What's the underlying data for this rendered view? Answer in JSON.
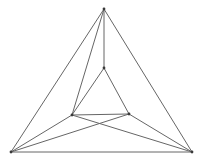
{
  "figure": {
    "canvas": {
      "width": 203,
      "height": 163,
      "background": "#ffffff"
    },
    "style": {
      "stroke_color": "#666666",
      "stroke_width": 1,
      "vertex_color": "#3a3a3a"
    },
    "vertices": [
      {
        "id": "outer-apex",
        "name": "outer-top-vertex",
        "x": 104,
        "y": 9
      },
      {
        "id": "outer-bottom-left",
        "name": "outer-bottom-left-vertex",
        "x": 11,
        "y": 152
      },
      {
        "id": "outer-bottom-right",
        "name": "outer-bottom-right-vertex",
        "x": 192,
        "y": 152
      },
      {
        "id": "inner-apex",
        "name": "inner-top-vertex",
        "x": 104,
        "y": 68
      },
      {
        "id": "inner-bottom-left",
        "name": "inner-bottom-left-vertex",
        "x": 72,
        "y": 115
      },
      {
        "id": "inner-bottom-right",
        "name": "inner-bottom-right-vertex",
        "x": 129,
        "y": 114
      }
    ],
    "edges": [
      {
        "id": "outer-left-edge",
        "name": "outer-left-edge",
        "from": "outer-apex",
        "to": "outer-bottom-left"
      },
      {
        "id": "outer-right-edge",
        "name": "outer-right-edge",
        "from": "outer-apex",
        "to": "outer-bottom-right"
      },
      {
        "id": "outer-bottom-edge",
        "name": "outer-bottom-edge",
        "from": "outer-bottom-left",
        "to": "outer-bottom-right"
      },
      {
        "id": "inner-left-edge",
        "name": "inner-left-edge",
        "from": "inner-apex",
        "to": "inner-bottom-left"
      },
      {
        "id": "inner-right-edge",
        "name": "inner-right-edge",
        "from": "inner-apex",
        "to": "inner-bottom-right"
      },
      {
        "id": "inner-bottom-edge",
        "name": "inner-bottom-edge",
        "from": "inner-bottom-left",
        "to": "inner-bottom-right"
      },
      {
        "id": "apex-to-inner-apex",
        "name": "connector-apex-vertical",
        "from": "outer-apex",
        "to": "inner-apex"
      },
      {
        "id": "apex-to-inner-left",
        "name": "connector-apex-inner-left",
        "from": "outer-apex",
        "to": "inner-bottom-left"
      },
      {
        "id": "bl-to-inner-left",
        "name": "connector-bottomleft-inner-left",
        "from": "outer-bottom-left",
        "to": "inner-bottom-left"
      },
      {
        "id": "bl-to-inner-right",
        "name": "connector-bottomleft-inner-right",
        "from": "outer-bottom-left",
        "to": "inner-bottom-right"
      },
      {
        "id": "br-to-inner-right",
        "name": "connector-bottomright-inner-right",
        "from": "outer-bottom-right",
        "to": "inner-bottom-right"
      },
      {
        "id": "br-to-inner-left",
        "name": "connector-bottomright-inner-left",
        "from": "outer-bottom-right",
        "to": "inner-bottom-left"
      }
    ]
  }
}
